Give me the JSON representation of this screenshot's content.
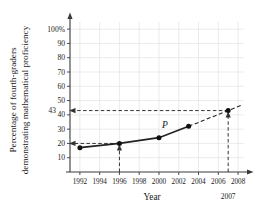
{
  "chart_data": {
    "type": "line",
    "title": "",
    "xlabel": "Year",
    "ylabel_line1": "Percentage of fourth-graders",
    "ylabel_line2": "demonstrating mathematical proficiency",
    "curve_label": "P",
    "x": [
      1992,
      1996,
      2000,
      2003,
      2007
    ],
    "values": [
      17,
      20,
      24,
      32,
      43
    ],
    "solid_segment_x": [
      1992,
      1996,
      2000,
      2003
    ],
    "dashed_segment_x": [
      2003,
      2007,
      2008.4
    ],
    "xlim": [
      1991.0,
      2008.6
    ],
    "ylim": [
      0,
      105
    ],
    "xticks": [
      1992,
      1994,
      1996,
      1998,
      2000,
      2002,
      2004,
      2006,
      2008
    ],
    "xtick_labels": [
      "1992",
      "1994",
      "1996",
      "1998",
      "2000",
      "2002",
      "2004",
      "2006",
      "2008"
    ],
    "yticks": [
      10,
      20,
      30,
      40,
      50,
      60,
      70,
      80,
      90,
      100
    ],
    "ytick_labels": [
      "10",
      "20",
      "30",
      "40",
      "50",
      "60",
      "70",
      "80",
      "90",
      "100%"
    ],
    "grid": true,
    "legend": "none",
    "annotations": [
      {
        "name": "highlight-value-43",
        "text": "43",
        "x": 1991.0,
        "y": 43
      },
      {
        "name": "highlight-year-2007",
        "text": "2007",
        "x": 2007,
        "y": -12
      }
    ],
    "guides": [
      {
        "name": "guide-1996-vertical",
        "from_x": 1996,
        "from_y": 0,
        "to_x": 1996,
        "to_y": 20,
        "arrow": "up"
      },
      {
        "name": "guide-1996-horizontal",
        "from_x": 1996,
        "from_y": 20,
        "to_x": 1991.0,
        "to_y": 20,
        "arrow": "left"
      },
      {
        "name": "guide-2007-vertical",
        "from_x": 2007,
        "from_y": 0,
        "to_x": 2007,
        "to_y": 43,
        "arrow": "up"
      },
      {
        "name": "guide-2007-horizontal",
        "from_x": 2007,
        "from_y": 43,
        "to_x": 1991.0,
        "to_y": 43,
        "arrow": "left"
      }
    ]
  }
}
